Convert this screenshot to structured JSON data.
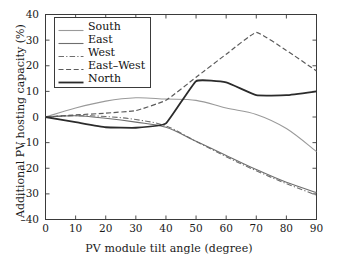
{
  "chart_data": {
    "type": "line",
    "title": "",
    "xlabel": "PV module tilt angle (degree)",
    "ylabel": "Additional PV hosting capacity (%)",
    "xlim": [
      0,
      90
    ],
    "ylim": [
      -40,
      40
    ],
    "xticks": [
      "0",
      "10",
      "20",
      "30",
      "40",
      "50",
      "60",
      "70",
      "80",
      "90"
    ],
    "yticks": [
      "40",
      "30",
      "20",
      "10",
      "0",
      "–10",
      "–20",
      "–30",
      "–40"
    ],
    "grid": false,
    "legend_position": "upper left",
    "x": [
      0,
      10,
      20,
      30,
      40,
      50,
      60,
      70,
      80,
      90
    ],
    "series": [
      {
        "name": "South",
        "style": "solid",
        "color": "#9a9a9a",
        "width": 1.1,
        "values": [
          0,
          3.5,
          6.2,
          7.5,
          7.0,
          6.5,
          3.5,
          1.0,
          -4.5,
          -13.5
        ]
      },
      {
        "name": "East",
        "style": "solid",
        "color": "#6e6e6e",
        "width": 1.1,
        "values": [
          0,
          0.5,
          -0.5,
          -2.0,
          -4.0,
          -9.5,
          -15.0,
          -20.5,
          -25.5,
          -29.5
        ]
      },
      {
        "name": "West",
        "style": "dashdot",
        "color": "#6e6e6e",
        "width": 1.1,
        "values": [
          0,
          0.5,
          0.2,
          -1.0,
          -3.5,
          -9.5,
          -15.5,
          -21.0,
          -26.0,
          -30.5
        ]
      },
      {
        "name": "East–West",
        "style": "dashed",
        "color": "#5a5a5a",
        "width": 1.2,
        "values": [
          0,
          0.8,
          1.5,
          2.5,
          6.5,
          15.5,
          24.5,
          33.0,
          26.0,
          18.0
        ]
      },
      {
        "name": "North",
        "style": "solid",
        "color": "#2b2b2b",
        "width": 1.8,
        "values": [
          0,
          -2.0,
          -4.0,
          -4.2,
          -2.5,
          14.0,
          13.5,
          8.5,
          8.5,
          10.0
        ]
      }
    ]
  },
  "legend": {
    "items": [
      {
        "label": "South"
      },
      {
        "label": "East"
      },
      {
        "label": "West"
      },
      {
        "label": "East–West"
      },
      {
        "label": "North"
      }
    ]
  }
}
